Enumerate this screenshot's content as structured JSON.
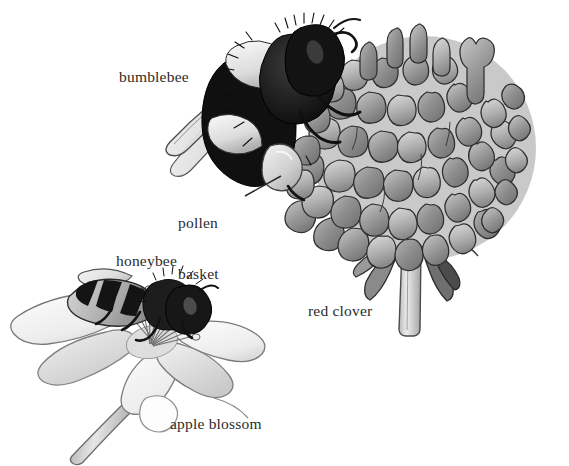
{
  "figure": {
    "background_color": "#ffffff",
    "ink_color": "#2b2b2b",
    "style": "grayscale pen-and-ink scientific illustration"
  },
  "labels": {
    "bumblebee": "bumblebee",
    "pollen_basket_line1": "pollen",
    "pollen_basket_line2": "basket",
    "honeybee": "honeybee",
    "red_clover": "red clover",
    "apple_blossom": "apple blossom"
  },
  "subjects": [
    {
      "name": "bumblebee",
      "label": "bumblebee",
      "description": "Furry bumblebee in left profile with banded black and pale abdomen, translucent wings sweeping down-left, head and antennae at upper right, feeding at the red clover head.",
      "parts": [
        "head",
        "antenna",
        "thorax",
        "abdomen",
        "wing",
        "legs",
        "pollen basket"
      ]
    },
    {
      "name": "red-clover",
      "label": "red clover",
      "description": "Dense globular clover flower head built of many overlapping tubular gray florets with notched tips, on a pale vertical stem with dark bracts at the base.",
      "parts": [
        "flower head",
        "florets",
        "bracts",
        "stem"
      ]
    },
    {
      "name": "honeybee",
      "label": "honeybee",
      "description": "Honeybee in left profile standing on the apple blossom, striped abdomen, dark thorax and head, wings folded back over the body.",
      "parts": [
        "head",
        "thorax",
        "striped abdomen",
        "wings",
        "legs"
      ]
    },
    {
      "name": "apple-blossom",
      "label": "apple blossom",
      "description": "Five pale broad petals radiating outward around a center of long stamens tipped with rounded anthers, on a slender stem angling down-left.",
      "parts": [
        "petals",
        "stamens",
        "anthers",
        "stem"
      ]
    }
  ],
  "callouts": [
    {
      "name": "pollen-basket",
      "label": "pollen basket",
      "target": "pale bulging pollen load on the bumblebee hind leg",
      "leader_from": [
        245,
        196
      ],
      "leader_to": [
        281,
        176
      ]
    }
  ],
  "palette": {
    "ink": "#2b2b2b",
    "outline": "#3a3a3a",
    "mid_gray": "#8d8d8d",
    "light_gray": "#c9c9c9",
    "pale": "#ececec",
    "dark": "#1a1a1a",
    "white": "#ffffff"
  }
}
